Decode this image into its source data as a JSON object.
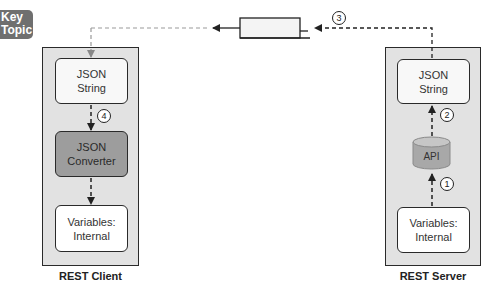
{
  "badge": {
    "line1": "Key",
    "line2": "Topic"
  },
  "client": {
    "label": "REST Client",
    "boxes": [
      {
        "line": "JSON\nString"
      },
      {
        "line": "JSON\nConverter"
      },
      {
        "line": "Variables:\nInternal"
      }
    ]
  },
  "server": {
    "label": "REST Server",
    "boxes": [
      {
        "line": "JSON\nString"
      },
      {
        "line": "API"
      },
      {
        "line": "Variables:\nInternal"
      }
    ]
  },
  "steps": [
    "1",
    "2",
    "3",
    "4"
  ],
  "colors": {
    "container_bg": "#e2e2e2",
    "converter_bg": "#9d9d9d",
    "api_bg": "#a8a8a8",
    "border": "#2a2a2a"
  }
}
